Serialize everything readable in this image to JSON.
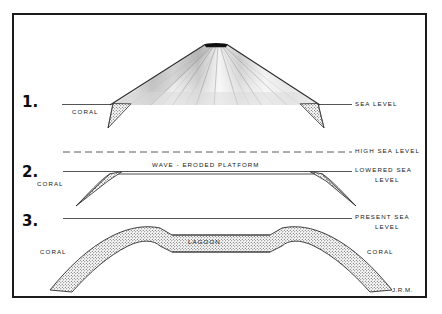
{
  "figure": {
    "signature": "J.R.M.",
    "frame_color": "#1b1b1b",
    "background_color": "#ffffff",
    "ink_color": "#171717",
    "coral_stipple_color": "#3a3a3a",
    "volcano_shade_color": "#9a9a9a"
  },
  "panels": [
    {
      "number": "1.",
      "labels": {
        "left_coral": "CORAL",
        "right_sea_level": "SEA LEVEL"
      }
    },
    {
      "number": "2.",
      "labels": {
        "left_coral": "CORAL",
        "platform": "WAVE - ERODED  PLATFORM",
        "high_sea_level": "HIGH SEA LEVEL",
        "lowered_sea": "LOWERED SEA",
        "lowered_level": "LEVEL"
      }
    },
    {
      "number": "3.",
      "labels": {
        "left_coral": "CORAL",
        "right_coral": "CORAL",
        "lagoon": "LAGOON",
        "present_sea": "PRESENT SEA",
        "present_level": "LEVEL"
      }
    }
  ]
}
